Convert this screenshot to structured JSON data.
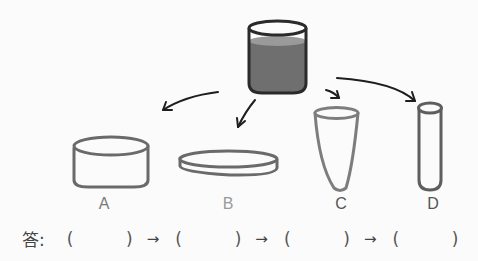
{
  "source_container": {
    "name": "beaker with liquid",
    "liquid_color": "#6f6f6f",
    "outline_color": "#2a2a2a"
  },
  "containers": [
    {
      "id": "A",
      "label": "A",
      "shape": "short wide cylinder"
    },
    {
      "id": "B",
      "label": "B",
      "shape": "flat dish"
    },
    {
      "id": "C",
      "label": "C",
      "shape": "cone cup"
    },
    {
      "id": "D",
      "label": "D",
      "shape": "test tube"
    }
  ],
  "answer": {
    "prefix": "答:",
    "open": "(",
    "close": ")",
    "arrow": "→",
    "slots": [
      "",
      "",
      "",
      ""
    ]
  },
  "colors": {
    "outline": "#6a6a6a",
    "label": "#7a7a7a",
    "arrow": "#1e1e1e"
  }
}
